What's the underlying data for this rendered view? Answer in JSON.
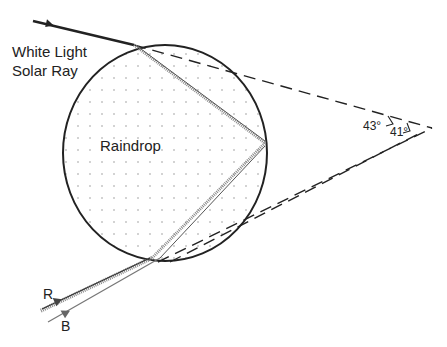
{
  "diagram": {
    "labels": {
      "solar_ray_line1": "White Light",
      "solar_ray_line2": "Solar Ray",
      "raindrop": "Raindrop",
      "angle_red": "43°",
      "angle_blue": "41°",
      "red": "R",
      "blue": "B"
    },
    "colors": {
      "ink": "#222222",
      "dots": "#9a9a9a",
      "refracted": "#888888",
      "background": "#ffffff"
    },
    "geometry": {
      "drop_center": [
        165,
        153
      ],
      "drop_radius": [
        102,
        108
      ],
      "entry_point": [
        134,
        45
      ],
      "reflection_point": [
        265,
        143
      ],
      "exit_point": [
        152,
        258
      ],
      "apex_red": [
        432,
        128
      ],
      "apex_blue": [
        420,
        133
      ]
    }
  }
}
